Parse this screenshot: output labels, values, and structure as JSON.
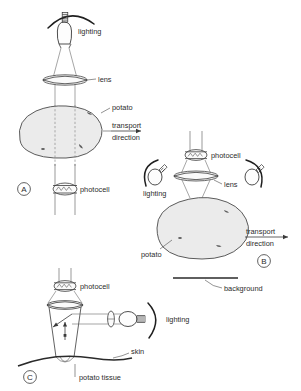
{
  "figure": {
    "background_color": "#ffffff",
    "ink_color": "#3a3a3a",
    "potato_fill": "#ebebeb"
  },
  "panels": [
    {
      "id": "A",
      "marker": "A",
      "labels": {
        "lighting": "lighting",
        "lens": "lens",
        "potato": "potato",
        "transport_line1": "transport",
        "transport_line2": "direction",
        "photocell": "photocell"
      },
      "icons": {
        "lamp": "lamp-icon",
        "lens": "lens-icon",
        "photocell": "photocell-icon",
        "arc": "lighting-arc-icon",
        "arrow": "transport-arrow-icon"
      }
    },
    {
      "id": "B",
      "marker": "B",
      "labels": {
        "photocell": "photocell",
        "lens": "lens",
        "lighting": "lighting",
        "potato": "potato",
        "transport_line1": "transport",
        "transport_line2": "direction",
        "background": "background"
      },
      "icons": {
        "lamp_left": "lamp-icon",
        "lamp_right": "lamp-icon",
        "lens": "lens-icon",
        "photocell": "photocell-icon",
        "background_bar": "background-bar-icon",
        "arrow": "transport-arrow-icon"
      }
    },
    {
      "id": "C",
      "marker": "C",
      "labels": {
        "photocell": "photocell",
        "lighting": "lighting",
        "skin": "skin",
        "potato_tissue": "potato tissue"
      },
      "icons": {
        "lamp": "lamp-icon",
        "lens": "lens-icon",
        "photocell": "photocell-icon",
        "probe": "probe-cone-icon",
        "skin": "skin-curve-icon",
        "arc": "lighting-arc-icon"
      }
    }
  ]
}
